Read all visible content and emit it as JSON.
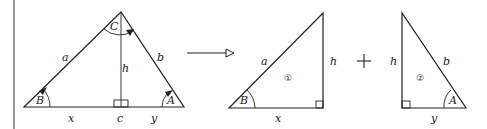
{
  "colors": {
    "stroke": "#222222",
    "margin_bar": "#9a9a9a",
    "background": "#ffffff"
  },
  "big_triangle": {
    "vertex_labels": {
      "apex": "C",
      "left": "B",
      "right": "A"
    },
    "side_labels": {
      "left": "a",
      "right": "b",
      "altitude": "h"
    },
    "base_labels": {
      "left_segment": "x",
      "foot": "c",
      "right_segment": "y"
    }
  },
  "transform_arrow": {
    "icon": "hollow-arrow-right-icon"
  },
  "triangle_1": {
    "number": "①",
    "angle_label": "B",
    "hypotenuse_label": "a",
    "vertical_label": "h",
    "base_label": "x"
  },
  "plus_sign": "+",
  "triangle_2": {
    "number": "②",
    "angle_label": "A",
    "hypotenuse_label": "b",
    "vertical_label": "h",
    "base_label": "y"
  }
}
